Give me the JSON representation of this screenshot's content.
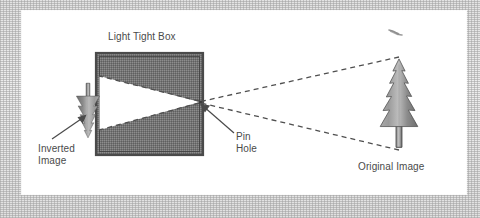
{
  "figure": {
    "type": "diagram",
    "title_visible": false
  },
  "labels": {
    "light_tight_box": "Light Tight Box",
    "inverted_image": "Inverted\nImage",
    "pin_hole": "Pin\nHole",
    "original_image": "Original Image"
  },
  "colors": {
    "page_background": "#e9e9e9",
    "panel_background": "#ffffff",
    "box_fill": "#6e6e6e",
    "box_border": "#565656",
    "light_cone": "#ffffff",
    "dashed_ray": "#555555",
    "text": "#4a4a4a",
    "tree_light": "#b4b4b4",
    "tree_dark": "#585858",
    "arrow": "#4a4a4a"
  },
  "elements": {
    "light_tight_box": {
      "x": 96,
      "y": 53,
      "width": 107,
      "height": 102
    },
    "pin_hole": {
      "x": 200,
      "y": 102
    },
    "inverted_tree": {
      "x": 88,
      "y": 110,
      "orientation": "inverted"
    },
    "original_tree": {
      "x": 399,
      "y": 110,
      "orientation": "upright"
    },
    "bird_mark": {
      "x": 396,
      "y": 32
    }
  },
  "rays": [
    {
      "name": "ray-top-of-tree",
      "from": [
        399,
        58
      ],
      "to": [
        200,
        102
      ],
      "style": "dashed"
    },
    {
      "name": "ray-base-of-tree",
      "from": [
        399,
        150
      ],
      "to": [
        200,
        102
      ],
      "style": "dashed"
    },
    {
      "name": "ray-inside-box-upper",
      "from": [
        200,
        102
      ],
      "to": [
        99,
        77
      ],
      "style": "dashed"
    },
    {
      "name": "ray-inside-box-lower",
      "from": [
        200,
        102
      ],
      "to": [
        99,
        129
      ],
      "style": "dashed"
    }
  ],
  "icons": {
    "arrow_inverted": "arrow-icon",
    "arrow_pinhole": "arrow-icon",
    "tree": "conifer-tree-icon",
    "bird": "bird-icon"
  }
}
